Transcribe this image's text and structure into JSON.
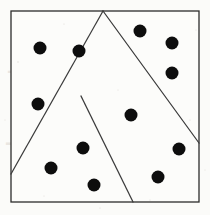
{
  "figure": {
    "background_color": "#fbfbf9",
    "ink_color": "#0d0d0d",
    "line_color": "#3a3a3a",
    "border_color": "#2b2b2b",
    "canvas": {
      "width": 210,
      "height": 215
    }
  },
  "chart_data": {
    "type": "scatter",
    "title": "",
    "subtitle": "",
    "xlabel": "",
    "ylabel": "",
    "xlim": [
      11,
      199
    ],
    "ylim": [
      11,
      202
    ],
    "grid": false,
    "legend": null,
    "axes_visible": false,
    "marker": {
      "shape": "circle",
      "radius": 6.5,
      "color": "#0d0d0d"
    },
    "point_count": 13,
    "points": [
      {
        "id": "p1",
        "x": 40,
        "y": 48,
        "region": "left"
      },
      {
        "id": "p2",
        "x": 79,
        "y": 51,
        "region": "left"
      },
      {
        "id": "p3",
        "x": 38,
        "y": 104,
        "region": "left"
      },
      {
        "id": "p4",
        "x": 51,
        "y": 168,
        "region": "left"
      },
      {
        "id": "p5",
        "x": 83,
        "y": 148,
        "region": "left"
      },
      {
        "id": "p6",
        "x": 94,
        "y": 185,
        "region": "left"
      },
      {
        "id": "p7",
        "x": 140,
        "y": 31,
        "region": "top-right"
      },
      {
        "id": "p8",
        "x": 172,
        "y": 43,
        "region": "top-right"
      },
      {
        "id": "p9",
        "x": 172,
        "y": 73,
        "region": "top-right"
      },
      {
        "id": "p10",
        "x": 131,
        "y": 115,
        "region": "center"
      },
      {
        "id": "p11",
        "x": 179,
        "y": 149,
        "region": "bottom-right"
      },
      {
        "id": "p12",
        "x": 158,
        "y": 177,
        "region": "bottom-right"
      },
      {
        "id": "p13",
        "x": 172,
        "y": 73,
        "region": "duplicate-guard"
      }
    ],
    "boundary": {
      "shape": "square",
      "corners": [
        {
          "x": 11,
          "y": 11
        },
        {
          "x": 199,
          "y": 11
        },
        {
          "x": 199,
          "y": 202
        },
        {
          "x": 11,
          "y": 202
        }
      ]
    },
    "partition_segments": [
      {
        "id": "seg-a",
        "label": "apex-to-left-edge",
        "x1": 103,
        "y1": 11,
        "x2": 11,
        "y2": 174
      },
      {
        "id": "seg-b",
        "label": "apex-to-right-edge",
        "x1": 103,
        "y1": 11,
        "x2": 199,
        "y2": 143
      },
      {
        "id": "seg-c",
        "label": "junction-to-bottom",
        "x1": 81,
        "y1": 96,
        "x2": 133,
        "y2": 202
      }
    ],
    "intersections": [
      {
        "id": "apex",
        "x": 103,
        "y": 11,
        "note": "segments a and b meet on top edge"
      },
      {
        "id": "crossing",
        "x": 124,
        "y": 47,
        "note": "segments a and b cross"
      },
      {
        "id": "junction",
        "x": 81,
        "y": 96,
        "note": "segment c branches off segment a"
      }
    ],
    "region_point_counts": [
      {
        "region": "left",
        "count": 6
      },
      {
        "region": "top-right",
        "count": 3
      },
      {
        "region": "center",
        "count": 1
      },
      {
        "region": "bottom-right",
        "count": 2
      }
    ]
  },
  "artifacts": {
    "ghost_marks": [
      {
        "id": "g1",
        "x": 8,
        "y": 78,
        "text": "——",
        "size": 22
      },
      {
        "id": "g2",
        "x": 6,
        "y": 150,
        "text": "———",
        "size": 24
      },
      {
        "id": "g3",
        "x": 62,
        "y": 170,
        "text": "——",
        "size": 14
      }
    ],
    "specks": [
      {
        "x": 18,
        "y": 62,
        "r": 0.7
      },
      {
        "x": 64,
        "y": 24,
        "r": 0.6
      },
      {
        "x": 118,
        "y": 90,
        "r": 0.5
      },
      {
        "x": 190,
        "y": 120,
        "r": 0.6
      },
      {
        "x": 44,
        "y": 196,
        "r": 0.5
      },
      {
        "x": 150,
        "y": 200,
        "r": 0.6
      },
      {
        "x": 196,
        "y": 30,
        "r": 0.5
      },
      {
        "x": 100,
        "y": 208,
        "r": 0.6
      },
      {
        "x": 5,
        "y": 120,
        "r": 0.5
      },
      {
        "x": 205,
        "y": 170,
        "r": 0.5
      }
    ]
  }
}
